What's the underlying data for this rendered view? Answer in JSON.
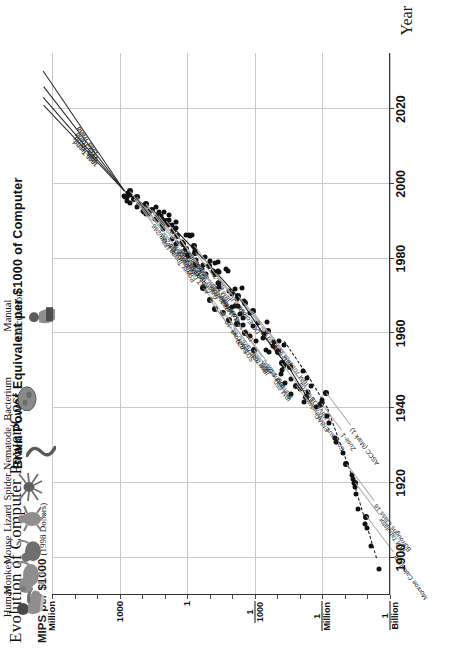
{
  "figure": {
    "main_title": "Evolution of Computer Power/Cost",
    "secondary_title": "Brain Power Equivalent per $1000 of Computer",
    "y_axis_label": "MIPS per $1000",
    "y_axis_label_paren": "(1998 Dollars)",
    "x_axis_label": "Year"
  },
  "chart_data": {
    "type": "scatter",
    "title": "Evolution of Computer Power/Cost",
    "subtitle": "Brain Power Equivalent per $1000 of Computer",
    "xlabel": "Year",
    "ylabel": "MIPS per $1000 (1998 Dollars)",
    "xlim": [
      1890,
      2035
    ],
    "ylim_log10": [
      -9,
      6
    ],
    "grid": true,
    "x_ticks": [
      "1900",
      "1920",
      "1940",
      "1960",
      "1980",
      "2000",
      "2020"
    ],
    "x_tick_values": [
      1900,
      1920,
      1940,
      1960,
      1980,
      2000,
      2020
    ],
    "y_ticks": [
      {
        "label": "Million",
        "log10": 6
      },
      {
        "label": "1000",
        "log10": 3
      },
      {
        "label": "1",
        "log10": 0
      },
      {
        "label": "1/1000",
        "num": "1",
        "den": "1000",
        "log10": -3
      },
      {
        "label": "1/Million",
        "num": "1",
        "den": "Million",
        "log10": -6
      },
      {
        "label": "1/Billion",
        "num": "1",
        "den": "Billion",
        "log10": -9
      }
    ],
    "labeled_points": [
      {
        "name": "Mac G3/266",
        "year": 1998.0,
        "log10": 2.55
      },
      {
        "name": "Gateway G6-200",
        "year": 1996.5,
        "log10": 2.25
      },
      {
        "name": "PowerMac 8100/80",
        "year": 1994.5,
        "log10": 1.85
      },
      {
        "name": "Gateway-486DX2/66",
        "year": 1993.0,
        "log10": 1.55
      },
      {
        "name": "Mac II",
        "year": 1987.5,
        "log10": 0.62
      },
      {
        "name": "Macintosh-128K",
        "year": 1984.0,
        "log10": 0.18
      },
      {
        "name": "Commodore 64",
        "year": 1982.5,
        "log10": 0.05
      },
      {
        "name": "IBM PC",
        "year": 1981.5,
        "log10": -0.35
      },
      {
        "name": "Sun-2",
        "year": 1983.5,
        "log10": -0.3
      },
      {
        "name": "Apple II",
        "year": 1978.0,
        "log10": -0.95
      },
      {
        "name": "DG Eclipse",
        "year": 1976.0,
        "log10": -1.25
      },
      {
        "name": "CDC 7600",
        "year": 1970.0,
        "log10": -2.25
      },
      {
        "name": "DEC PDP-10",
        "year": 1968.0,
        "log10": -2.55
      },
      {
        "name": "IBM 1130",
        "year": 1966.0,
        "log10": -2.9
      },
      {
        "name": "IBM 7090",
        "year": 1960.5,
        "log10": -3.6
      },
      {
        "name": "Whirlwind",
        "year": 1952.0,
        "log10": -4.2
      },
      {
        "name": "IBM 704",
        "year": 1955.0,
        "log10": -4.05
      },
      {
        "name": "UNIVAC I",
        "year": 1951.0,
        "log10": -4.55
      },
      {
        "name": "ENIAC",
        "year": 1946.0,
        "log10": -4.85
      },
      {
        "name": "Colossus",
        "year": 1943.0,
        "log10": -5.25
      },
      {
        "name": "Zuse-1",
        "year": 1941.0,
        "log10": -5.95
      },
      {
        "name": "Burroughs Class 16",
        "year": 1925.0,
        "log10": -7.05
      },
      {
        "name": "IBM Tabulator",
        "year": 1920.0,
        "log10": -7.45
      },
      {
        "name": "Monroe Calculator",
        "year": 1911.0,
        "log10": -7.95
      },
      {
        "name": "ASCC (Mark 1)",
        "year": 1944.0,
        "log10": -6.15
      },
      {
        "name": "IBM 650",
        "year": 1955.5,
        "log10": -2.95
      },
      {
        "name": "IBM 1620",
        "year": 1960.0,
        "log10": -2.55
      },
      {
        "name": "Burroughs 5000",
        "year": 1962.5,
        "log10": -2.2
      },
      {
        "name": "IBM 7040",
        "year": 1963.5,
        "log10": -1.85
      },
      {
        "name": "IBM 360/75",
        "year": 1965.5,
        "log10": -1.6
      },
      {
        "name": "SDS 920",
        "year": 1966.5,
        "log10": -1.25
      },
      {
        "name": "DG Nova",
        "year": 1969.0,
        "log10": -1.0
      },
      {
        "name": "DEC-KL-10",
        "year": 1972.0,
        "log10": -0.7
      },
      {
        "name": "DEC VAX 11/780",
        "year": 1978.5,
        "log10": -0.4
      },
      {
        "name": "Vax 11/750",
        "year": 1981.0,
        "log10": -0.05
      },
      {
        "name": "Sun-3",
        "year": 1986.0,
        "log10": 0.45
      },
      {
        "name": "Mac IIfx",
        "year": 1990.0,
        "log10": 0.95
      },
      {
        "name": "IBM PS/2 90",
        "year": 1991.5,
        "log10": 1.3
      },
      {
        "name": "AT&T Globalyst 600",
        "year": 1994.0,
        "log10": 1.9
      },
      {
        "name": "Power Tower 180e",
        "year": 1996.0,
        "log10": 2.35
      }
    ],
    "trend_lines": [
      {
        "label": "1995 Trend",
        "from_year": 1998,
        "from_log10": 2.8,
        "to_year": 2021,
        "to_log10": 6.4
      },
      {
        "label": "1985 Trend",
        "from_year": 1998,
        "from_log10": 2.8,
        "to_year": 2023,
        "to_log10": 6.4
      },
      {
        "label": "1975 Trend",
        "from_year": 1998,
        "from_log10": 2.8,
        "to_year": 2026,
        "to_log10": 6.4
      },
      {
        "label": "1965 Trend",
        "from_year": 1998,
        "from_log10": 2.8,
        "to_year": 2030,
        "to_log10": 6.4
      }
    ],
    "brain_equivalents": [
      {
        "name": "Human",
        "icon": "human-icon",
        "log10": 6.3
      },
      {
        "name": "Monkey",
        "icon": "monkey-icon",
        "log10": 5.2
      },
      {
        "name": "Mouse",
        "icon": "mouse-icon",
        "log10": 4.0
      },
      {
        "name": "Lizard",
        "icon": "lizard-icon",
        "log10": 2.6
      },
      {
        "name": "Spider",
        "icon": "spider-icon",
        "log10": 1.2
      },
      {
        "name": "Nematode\nWorm",
        "icon": "worm-icon",
        "log10": -0.5
      },
      {
        "name": "Bacterium",
        "icon": "bacterium-icon",
        "log10": -2.7
      },
      {
        "name": "Manual\nCalculation",
        "icon": "manual-calc-icon",
        "log10": -6.4
      }
    ],
    "unlabeled_point_count": 96,
    "colors": {
      "ink": "#111111",
      "grid": "#c9c9c9",
      "leader": "#a8a8a8",
      "point": "#111111",
      "creature": "#8e8e8e"
    }
  }
}
